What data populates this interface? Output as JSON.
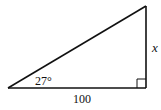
{
  "diagram": {
    "type": "right-triangle",
    "angle_label": "27°",
    "base_label": "100",
    "side_label": "x",
    "right_angle_marker": true,
    "stroke_color": "#111111",
    "background": "#ffffff"
  }
}
